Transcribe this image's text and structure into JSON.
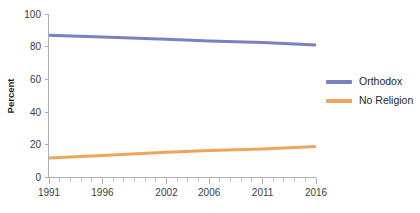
{
  "chart_data": {
    "type": "line",
    "title": "",
    "subtitle": "",
    "xlabel": "",
    "ylabel": "Percent",
    "xlim": [
      1991,
      2016
    ],
    "ylim": [
      0,
      100
    ],
    "grid": false,
    "legend_position": "right",
    "x_tick_labels": [
      "1991",
      "1996",
      "2002",
      "2006",
      "2011",
      "2016"
    ],
    "x_tick_values": [
      1991,
      1996,
      2002,
      2006,
      2011,
      2016
    ],
    "x_minor_tick_step": 1,
    "y_tick_labels": [
      "0",
      "20",
      "40",
      "60",
      "80",
      "100"
    ],
    "y_tick_values": [
      0,
      20,
      40,
      60,
      80,
      100
    ],
    "x": [
      1991,
      1996,
      2002,
      2006,
      2011,
      2016
    ],
    "series": [
      {
        "name": "Orthodox",
        "color": "#7b80c6",
        "values": [
          87,
          86,
          84.5,
          83.5,
          82.5,
          81
        ]
      },
      {
        "name": "No Religion",
        "color": "#eda45e",
        "values": [
          12,
          13.5,
          15.5,
          16.5,
          17.5,
          19
        ]
      }
    ]
  },
  "legend": {
    "items": [
      {
        "label": "Orthodox",
        "color": "#7b80c6"
      },
      {
        "label": "No Religion",
        "color": "#eda45e"
      }
    ]
  },
  "colors": {
    "orthodox": "#7b80c6",
    "no_religion": "#eda45e",
    "axis": "#b0b0b0",
    "text": "#3c3c3c",
    "background": "#ffffff"
  }
}
